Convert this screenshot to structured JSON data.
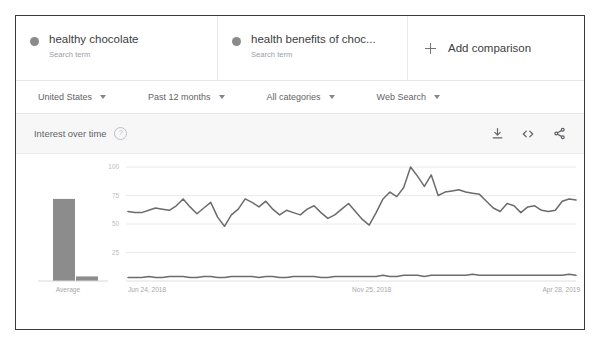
{
  "terms": [
    {
      "title": "healthy chocolate",
      "subtitle": "Search term",
      "dot": "series-dot"
    },
    {
      "title": "health benefits of choc...",
      "subtitle": "Search term",
      "dot": "series-dot"
    }
  ],
  "add_comparison": {
    "label": "Add comparison",
    "icon": "plus-icon"
  },
  "filters": [
    {
      "label": "United States"
    },
    {
      "label": "Past 12 months"
    },
    {
      "label": "All categories"
    },
    {
      "label": "Web Search"
    }
  ],
  "panel": {
    "title": "Interest over time",
    "help_icon": "?",
    "actions": [
      {
        "name": "download-icon"
      },
      {
        "name": "embed-icon"
      },
      {
        "name": "share-icon"
      }
    ]
  },
  "average_panel": {
    "label": "Average",
    "values": [
      72,
      4
    ]
  },
  "colors": {
    "line": "#6b6b6b",
    "bar": "#8c8c8c",
    "grid": "#eaeaea",
    "text": "#5f6368",
    "muted": "#9aa0a6",
    "frame": "#3a3a3a",
    "panel_bg": "#f7f7f7"
  },
  "chart_data": {
    "type": "line",
    "title": "Interest over time",
    "xlabel": "",
    "ylabel": "",
    "ylim": [
      0,
      100
    ],
    "yticks": [
      25,
      50,
      75,
      100
    ],
    "grid": true,
    "legend": "none",
    "xticks": [
      "Jun 24, 2018",
      "Nov 25, 2018",
      "Apr 28, 2019"
    ],
    "xtick_positions": [
      0,
      0.5,
      0.925
    ],
    "series": [
      {
        "name": "healthy chocolate",
        "color": "#6b6b6b",
        "values": [
          61,
          60,
          60,
          62,
          64,
          63,
          62,
          66,
          72,
          65,
          59,
          64,
          69,
          56,
          48,
          58,
          63,
          72,
          69,
          65,
          70,
          63,
          58,
          62,
          60,
          58,
          63,
          66,
          60,
          55,
          58,
          63,
          68,
          61,
          54,
          49,
          60,
          72,
          78,
          74,
          82,
          100,
          92,
          83,
          93,
          75,
          78,
          79,
          80,
          78,
          77,
          76,
          70,
          64,
          61,
          68,
          66,
          60,
          65,
          66,
          62,
          61,
          62,
          70,
          72,
          71
        ]
      },
      {
        "name": "health benefits of choc...",
        "color": "#6b6b6b",
        "values": [
          3,
          3,
          3,
          4,
          3,
          3,
          4,
          4,
          4,
          3,
          3,
          4,
          4,
          3,
          3,
          4,
          4,
          4,
          4,
          3,
          4,
          4,
          3,
          3,
          4,
          4,
          4,
          4,
          3,
          3,
          4,
          4,
          4,
          4,
          4,
          4,
          4,
          5,
          4,
          4,
          5,
          5,
          5,
          4,
          5,
          5,
          5,
          5,
          5,
          5,
          6,
          5,
          5,
          5,
          5,
          5,
          5,
          5,
          5,
          5,
          5,
          5,
          5,
          5,
          6,
          5
        ]
      }
    ]
  }
}
